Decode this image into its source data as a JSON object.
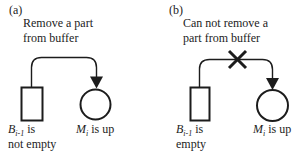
{
  "figure": {
    "description_colors": {
      "ink": "#1c1c1c",
      "background": "#ffffff"
    }
  },
  "panels": [
    {
      "tag": "(a)",
      "caption_line1": "Remove a part",
      "caption_line2": "from buffer",
      "crossed": false,
      "buffer_label": {
        "symbol": "B",
        "subscript": "i-1",
        "suffix": " is",
        "line2": "not empty"
      },
      "machine_label": {
        "symbol": "M",
        "subscript": "i",
        "suffix": " is up"
      }
    },
    {
      "tag": "(b)",
      "caption_line1": "Can not remove a",
      "caption_line2": "part from buffer",
      "crossed": true,
      "buffer_label": {
        "symbol": "B",
        "subscript": "i-1",
        "suffix": " is",
        "line2": "empty"
      },
      "machine_label": {
        "symbol": "M",
        "subscript": "i",
        "suffix": " is up"
      }
    }
  ]
}
